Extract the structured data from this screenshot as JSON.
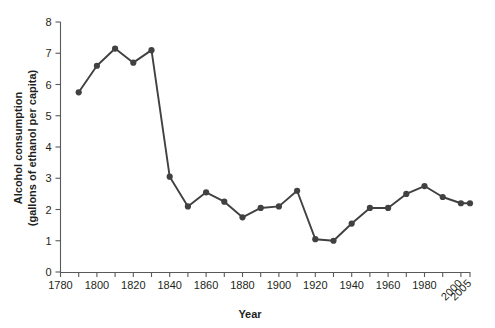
{
  "chart_data": {
    "type": "line",
    "title": "",
    "xlabel": "Year",
    "ylabel": "Alcohol consumption (gallons of ethanol per capita)",
    "ylabel_line1": "Alcohol consumption",
    "ylabel_line2": "(gallons of ethanol per capita)",
    "xlim": [
      1780,
      2005
    ],
    "ylim": [
      0,
      8
    ],
    "grid": false,
    "legend": "none",
    "y_ticks": [
      0,
      1,
      2,
      3,
      4,
      5,
      6,
      7,
      8
    ],
    "y_tick_labels": [
      "0",
      "1",
      "2",
      "3",
      "4",
      "5",
      "6",
      "7",
      "8"
    ],
    "x_major_ticks": [
      1780,
      1800,
      1820,
      1840,
      1860,
      1880,
      1900,
      1920,
      1940,
      1960,
      1980,
      2000,
      2005
    ],
    "x_major_tick_labels": [
      "1780",
      "1800",
      "1820",
      "1840",
      "1860",
      "1880",
      "1900",
      "1920",
      "1940",
      "1960",
      "1980",
      "2000",
      "2005"
    ],
    "x_rotated_labels": [
      "2000",
      "2005"
    ],
    "x_minor_ticks": [
      1790,
      1810,
      1830,
      1850,
      1870,
      1890,
      1910,
      1930,
      1950,
      1970,
      1990
    ],
    "series": [
      {
        "name": "Alcohol consumption",
        "color": "#414042",
        "x": [
          1790,
          1800,
          1810,
          1820,
          1830,
          1840,
          1850,
          1860,
          1870,
          1880,
          1890,
          1900,
          1910,
          1920,
          1930,
          1940,
          1950,
          1960,
          1970,
          1980,
          1990,
          2000,
          2005
        ],
        "values": [
          5.75,
          6.6,
          7.15,
          6.7,
          7.1,
          3.05,
          2.1,
          2.55,
          2.25,
          1.75,
          2.05,
          2.1,
          2.6,
          1.05,
          1.0,
          1.55,
          2.05,
          2.05,
          2.5,
          2.75,
          2.4,
          2.2,
          2.2
        ]
      }
    ]
  }
}
